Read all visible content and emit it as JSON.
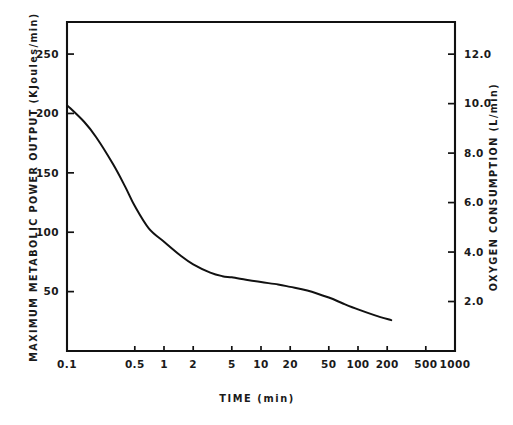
{
  "figure": {
    "background_color": "#ffffff",
    "ink_color": "#111111"
  },
  "chart_data": {
    "type": "line",
    "title": "",
    "subtitle": "",
    "xlabel": "TIME   (min)",
    "ylabel": "MAXIMUM  METABOLIC  POWER  OUTPUT   (KJoules/min)",
    "y2label": "OXYGEN  CONSUMPTION   (L/min)",
    "xscale": "log",
    "xlim": [
      0.1,
      1000
    ],
    "ylim": [
      0,
      277
    ],
    "y2lim": [
      0,
      13.3
    ],
    "grid": false,
    "legend": null,
    "legend_position": "none",
    "xticks": [
      0.1,
      0.5,
      1,
      2,
      5,
      10,
      20,
      50,
      100,
      200,
      500,
      1000
    ],
    "xticklabels": [
      "0.1",
      "0.5",
      "1",
      "2",
      "5",
      "10",
      "20",
      "50",
      "100",
      "200",
      "500",
      "1000"
    ],
    "yticks": [
      50,
      100,
      150,
      200,
      250
    ],
    "yticklabels": [
      "50",
      "100",
      "150",
      "200",
      "250"
    ],
    "y2ticks": [
      2.0,
      4.0,
      6.0,
      8.0,
      10.0,
      12.0
    ],
    "y2ticklabels": [
      "2.0",
      "4.0",
      "6.0",
      "8.0",
      "10.0",
      "12.0"
    ],
    "series": [
      {
        "name": "maximum metabolic power output",
        "x": [
          0.1,
          0.15,
          0.2,
          0.3,
          0.4,
          0.5,
          0.7,
          1.0,
          1.5,
          2.0,
          3.0,
          4.0,
          5.0,
          7.0,
          10.0,
          15.0,
          20.0,
          30.0,
          50.0,
          70.0,
          100.0,
          150.0,
          220.0
        ],
        "y": [
          207,
          193,
          180,
          157,
          138,
          122,
          103,
          92,
          80,
          73,
          66,
          63,
          62,
          60,
          58,
          56,
          54,
          51,
          45,
          40,
          35,
          30,
          26
        ]
      }
    ],
    "annotations": []
  },
  "axes_geometry": {
    "plot_left_px": 67,
    "plot_right_px": 455,
    "plot_top_px": 22,
    "plot_bottom_px": 351
  }
}
